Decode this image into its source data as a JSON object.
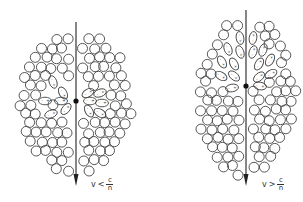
{
  "figure": {
    "panels": [
      {
        "id": "left",
        "condition_label": {
          "v": "v",
          "op": "<",
          "num": "c",
          "den": "n"
        },
        "trajectory": {
          "x": 76,
          "y_start": 22,
          "y_end": 186
        },
        "charge": {
          "x": 76,
          "y": 101
        },
        "shape": {
          "cx": 76,
          "cy": 102,
          "rx": 56,
          "ry": 72
        },
        "polarized_region": "symmetric around charge",
        "polarized": [
          {
            "x": 53,
            "y": 82,
            "angle": 70
          },
          {
            "x": 63,
            "y": 93,
            "angle": 60
          },
          {
            "x": 45,
            "y": 101,
            "angle": 0
          },
          {
            "x": 61,
            "y": 101,
            "angle": 0
          },
          {
            "x": 51,
            "y": 114,
            "angle": -20
          },
          {
            "x": 66,
            "y": 109,
            "angle": -50
          },
          {
            "x": 88,
            "y": 93,
            "angle": -30
          },
          {
            "x": 100,
            "y": 93,
            "angle": -20
          },
          {
            "x": 90,
            "y": 101,
            "angle": 0
          },
          {
            "x": 102,
            "y": 103,
            "angle": 0
          },
          {
            "x": 89,
            "y": 111,
            "angle": 60
          },
          {
            "x": 100,
            "y": 113,
            "angle": 30
          }
        ]
      },
      {
        "id": "right",
        "condition_label": {
          "v": "v",
          "op": ">",
          "num": "c",
          "den": "n"
        },
        "trajectory": {
          "x": 246,
          "y_start": 10,
          "y_end": 186
        },
        "charge": {
          "x": 246,
          "y": 86
        },
        "shape": {
          "cx": 246,
          "cy": 97,
          "rx": 50,
          "ry": 80
        },
        "polarized_region": "cone behind charge",
        "polarized": [
          {
            "x": 240,
            "y": 38,
            "angle": 80
          },
          {
            "x": 228,
            "y": 49,
            "angle": 70
          },
          {
            "x": 240,
            "y": 52,
            "angle": 70
          },
          {
            "x": 222,
            "y": 62,
            "angle": 60
          },
          {
            "x": 234,
            "y": 64,
            "angle": 60
          },
          {
            "x": 221,
            "y": 76,
            "angle": 30
          },
          {
            "x": 234,
            "y": 76,
            "angle": 40
          },
          {
            "x": 232,
            "y": 88,
            "angle": -10
          },
          {
            "x": 253,
            "y": 38,
            "angle": -80
          },
          {
            "x": 263,
            "y": 50,
            "angle": -70
          },
          {
            "x": 253,
            "y": 52,
            "angle": -70
          },
          {
            "x": 270,
            "y": 60,
            "angle": -60
          },
          {
            "x": 259,
            "y": 64,
            "angle": -60
          },
          {
            "x": 271,
            "y": 74,
            "angle": -30
          },
          {
            "x": 259,
            "y": 77,
            "angle": -40
          },
          {
            "x": 260,
            "y": 86,
            "angle": 10
          }
        ]
      }
    ]
  }
}
